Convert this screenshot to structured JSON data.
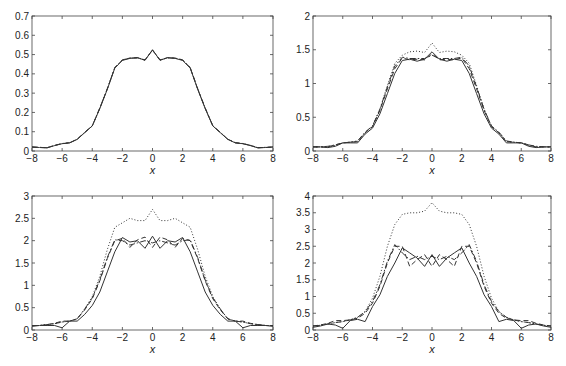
{
  "figure": {
    "width": 566,
    "height": 366,
    "background": "#ffffff",
    "line_color": "#333333"
  },
  "line_styles": {
    "solid": {
      "dash": "",
      "width": 1.0
    },
    "dashed": {
      "dash": "5,3",
      "width": 1.0
    },
    "dashdot": {
      "dash": "6,2,1.5,2",
      "width": 1.0
    },
    "dotted": {
      "dash": "1,2",
      "width": 1.0
    }
  },
  "chart_data": [
    {
      "type": "line",
      "panel": "top-left",
      "title": "",
      "xlabel": "x",
      "ylabel": "",
      "xlim": [
        -8,
        8
      ],
      "ylim": [
        0,
        0.7
      ],
      "xticks": [
        -8,
        -6,
        -4,
        -2,
        0,
        2,
        4,
        6,
        8
      ],
      "xtick_labels": [
        "−8",
        "−6",
        "−4",
        "−2",
        "0",
        "2",
        "4",
        "6",
        "8"
      ],
      "yticks": [
        0,
        0.1,
        0.2,
        0.3,
        0.4,
        0.5,
        0.6,
        0.7
      ],
      "ytick_labels": [
        "0",
        "0.1",
        "0.2",
        "0.3",
        "0.4",
        "0.5",
        "0.6",
        "0.7"
      ],
      "grid": false,
      "legend": null,
      "box": {
        "left": 32,
        "top": 16,
        "right": 273,
        "bottom": 151
      },
      "x": [
        -8,
        -7.5,
        -7,
        -6.5,
        -6,
        -5.5,
        -5,
        -4.5,
        -4,
        -3.5,
        -3,
        -2.5,
        -2,
        -1.5,
        -1,
        -0.5,
        0,
        0.5,
        1,
        1.5,
        2,
        2.5,
        3,
        3.5,
        4,
        4.5,
        5,
        5.5,
        6,
        6.5,
        7,
        7.5,
        8
      ],
      "series": [
        {
          "name": "solid",
          "style": "solid",
          "values": [
            0.02,
            0.018,
            0.016,
            0.028,
            0.038,
            0.042,
            0.06,
            0.095,
            0.13,
            0.22,
            0.32,
            0.43,
            0.47,
            0.48,
            0.485,
            0.47,
            0.525,
            0.47,
            0.485,
            0.48,
            0.47,
            0.43,
            0.32,
            0.22,
            0.13,
            0.095,
            0.06,
            0.042,
            0.038,
            0.028,
            0.016,
            0.018,
            0.02
          ]
        },
        {
          "name": "dashed",
          "style": "dashed",
          "values": [
            0.02,
            0.018,
            0.017,
            0.029,
            0.038,
            0.043,
            0.061,
            0.096,
            0.13,
            0.222,
            0.322,
            0.432,
            0.472,
            0.482,
            0.483,
            0.472,
            0.523,
            0.472,
            0.483,
            0.482,
            0.472,
            0.432,
            0.322,
            0.222,
            0.13,
            0.096,
            0.061,
            0.043,
            0.038,
            0.029,
            0.017,
            0.018,
            0.02
          ]
        },
        {
          "name": "dashdot",
          "style": "dashdot",
          "values": [
            0.021,
            0.019,
            0.017,
            0.029,
            0.039,
            0.043,
            0.061,
            0.097,
            0.131,
            0.223,
            0.323,
            0.433,
            0.473,
            0.481,
            0.482,
            0.473,
            0.522,
            0.473,
            0.482,
            0.481,
            0.473,
            0.433,
            0.323,
            0.223,
            0.131,
            0.097,
            0.061,
            0.043,
            0.039,
            0.029,
            0.017,
            0.019,
            0.021
          ]
        }
      ]
    },
    {
      "type": "line",
      "panel": "top-right",
      "title": "",
      "xlabel": "x",
      "ylabel": "",
      "xlim": [
        -8,
        8
      ],
      "ylim": [
        0,
        2
      ],
      "xticks": [
        -8,
        -6,
        -4,
        -2,
        0,
        2,
        4,
        6,
        8
      ],
      "xtick_labels": [
        "−8",
        "−6",
        "−4",
        "−2",
        "0",
        "2",
        "4",
        "6",
        "8"
      ],
      "yticks": [
        0,
        0.5,
        1,
        1.5,
        2
      ],
      "ytick_labels": [
        "0",
        "0.5",
        "1",
        "1.5",
        "2"
      ],
      "grid": false,
      "legend": null,
      "box": {
        "left": 313,
        "top": 16,
        "right": 551,
        "bottom": 151
      },
      "x": [
        -8,
        -7.5,
        -7,
        -6.5,
        -6,
        -5.5,
        -5,
        -4.5,
        -4,
        -3.5,
        -3,
        -2.5,
        -2,
        -1.5,
        -1,
        -0.5,
        0,
        0.5,
        1,
        1.5,
        2,
        2.5,
        3,
        3.5,
        4,
        4.5,
        5,
        5.5,
        6,
        6.5,
        7,
        7.5,
        8
      ],
      "series": [
        {
          "name": "solid",
          "style": "solid",
          "values": [
            0.06,
            0.06,
            0.05,
            0.07,
            0.12,
            0.12,
            0.12,
            0.25,
            0.34,
            0.55,
            0.85,
            1.15,
            1.34,
            1.36,
            1.33,
            1.36,
            1.47,
            1.36,
            1.33,
            1.36,
            1.34,
            1.15,
            0.85,
            0.55,
            0.34,
            0.25,
            0.12,
            0.12,
            0.12,
            0.07,
            0.05,
            0.06,
            0.06
          ]
        },
        {
          "name": "dashed",
          "style": "dashed",
          "values": [
            0.06,
            0.06,
            0.06,
            0.09,
            0.12,
            0.13,
            0.14,
            0.27,
            0.36,
            0.6,
            0.92,
            1.22,
            1.38,
            1.35,
            1.36,
            1.35,
            1.44,
            1.35,
            1.36,
            1.35,
            1.38,
            1.22,
            0.92,
            0.6,
            0.36,
            0.27,
            0.14,
            0.13,
            0.12,
            0.09,
            0.06,
            0.06,
            0.06
          ]
        },
        {
          "name": "dashdot",
          "style": "dashdot",
          "values": [
            0.06,
            0.06,
            0.07,
            0.09,
            0.12,
            0.13,
            0.15,
            0.28,
            0.37,
            0.62,
            0.95,
            1.26,
            1.39,
            1.37,
            1.37,
            1.37,
            1.42,
            1.37,
            1.37,
            1.37,
            1.39,
            1.26,
            0.95,
            0.62,
            0.37,
            0.28,
            0.15,
            0.13,
            0.12,
            0.09,
            0.07,
            0.06,
            0.06
          ]
        },
        {
          "name": "dotted",
          "style": "dotted",
          "values": [
            0.06,
            0.06,
            0.06,
            0.08,
            0.12,
            0.13,
            0.14,
            0.27,
            0.37,
            0.62,
            0.97,
            1.3,
            1.42,
            1.47,
            1.48,
            1.46,
            1.6,
            1.46,
            1.48,
            1.47,
            1.42,
            1.3,
            0.97,
            0.62,
            0.37,
            0.27,
            0.14,
            0.13,
            0.12,
            0.08,
            0.06,
            0.06,
            0.06
          ]
        }
      ]
    },
    {
      "type": "line",
      "panel": "bottom-left",
      "title": "",
      "xlabel": "x",
      "ylabel": "",
      "xlim": [
        -8,
        8
      ],
      "ylim": [
        0,
        3
      ],
      "xticks": [
        -8,
        -6,
        -4,
        -2,
        0,
        2,
        4,
        6,
        8
      ],
      "xtick_labels": [
        "−8",
        "−6",
        "−4",
        "−2",
        "0",
        "2",
        "4",
        "6",
        "8"
      ],
      "yticks": [
        0,
        0.5,
        1,
        1.5,
        2,
        2.5,
        3
      ],
      "ytick_labels": [
        "0",
        "0.5",
        "1",
        "1.5",
        "2",
        "2.5",
        "3"
      ],
      "grid": false,
      "legend": null,
      "box": {
        "left": 32,
        "top": 196,
        "right": 273,
        "bottom": 330
      },
      "x": [
        -8,
        -7.5,
        -7,
        -6.5,
        -6,
        -5.5,
        -5,
        -4.5,
        -4,
        -3.5,
        -3,
        -2.5,
        -2,
        -1.5,
        -1,
        -0.5,
        0,
        0.5,
        1,
        1.5,
        2,
        2.5,
        3,
        3.5,
        4,
        4.5,
        5,
        5.5,
        6,
        6.5,
        7,
        7.5,
        8
      ],
      "series": [
        {
          "name": "solid",
          "style": "solid",
          "values": [
            0.08,
            0.1,
            0.1,
            0.1,
            0.05,
            0.2,
            0.2,
            0.35,
            0.55,
            0.85,
            1.3,
            1.75,
            2.07,
            1.97,
            2.0,
            1.83,
            2.1,
            1.83,
            2.0,
            1.97,
            2.07,
            1.75,
            1.3,
            0.85,
            0.55,
            0.35,
            0.2,
            0.2,
            0.05,
            0.1,
            0.1,
            0.1,
            0.08
          ]
        },
        {
          "name": "dashed",
          "style": "dashed",
          "values": [
            0.1,
            0.1,
            0.12,
            0.15,
            0.2,
            0.2,
            0.25,
            0.45,
            0.7,
            1.1,
            1.6,
            2.0,
            2.05,
            1.85,
            2.02,
            2.08,
            1.85,
            2.08,
            2.02,
            1.85,
            2.05,
            2.0,
            1.6,
            1.1,
            0.7,
            0.45,
            0.25,
            0.2,
            0.2,
            0.15,
            0.12,
            0.1,
            0.1
          ]
        },
        {
          "name": "dashdot",
          "style": "dashdot",
          "values": [
            0.1,
            0.1,
            0.12,
            0.14,
            0.18,
            0.2,
            0.25,
            0.47,
            0.72,
            1.12,
            1.62,
            2.02,
            2.0,
            1.9,
            1.95,
            2.0,
            1.95,
            2.0,
            1.95,
            1.9,
            2.0,
            2.02,
            1.62,
            1.12,
            0.72,
            0.47,
            0.25,
            0.2,
            0.18,
            0.14,
            0.12,
            0.1,
            0.1
          ]
        },
        {
          "name": "dotted",
          "style": "dotted",
          "values": [
            0.1,
            0.1,
            0.12,
            0.14,
            0.18,
            0.2,
            0.25,
            0.47,
            0.75,
            1.2,
            1.8,
            2.3,
            2.4,
            2.5,
            2.45,
            2.45,
            2.7,
            2.45,
            2.45,
            2.5,
            2.4,
            2.3,
            1.8,
            1.2,
            0.75,
            0.47,
            0.25,
            0.2,
            0.18,
            0.14,
            0.12,
            0.1,
            0.1
          ]
        }
      ]
    },
    {
      "type": "line",
      "panel": "bottom-right",
      "title": "",
      "xlabel": "x",
      "ylabel": "",
      "xlim": [
        -8,
        8
      ],
      "ylim": [
        0,
        4
      ],
      "xticks": [
        -8,
        -6,
        -4,
        -2,
        0,
        2,
        4,
        6,
        8
      ],
      "xtick_labels": [
        "−8",
        "−6",
        "−4",
        "−2",
        "0",
        "2",
        "4",
        "6",
        "8"
      ],
      "yticks": [
        0,
        0.5,
        1,
        1.5,
        2,
        2.5,
        3,
        3.5,
        4
      ],
      "ytick_labels": [
        "0",
        "0.5",
        "1",
        "1.5",
        "2",
        "2.5",
        "3",
        "3.5",
        "4"
      ],
      "grid": false,
      "legend": null,
      "box": {
        "left": 313,
        "top": 196,
        "right": 551,
        "bottom": 330
      },
      "x": [
        -8,
        -7.5,
        -7,
        -6.5,
        -6,
        -5.5,
        -5,
        -4.5,
        -4,
        -3.5,
        -3,
        -2.5,
        -2,
        -1.5,
        -1,
        -0.5,
        0,
        0.5,
        1,
        1.5,
        2,
        2.5,
        3,
        3.5,
        4,
        4.5,
        5,
        5.5,
        6,
        6.5,
        7,
        7.5,
        8
      ],
      "series": [
        {
          "name": "solid",
          "style": "solid",
          "values": [
            0.08,
            0.12,
            0.18,
            0.15,
            0.05,
            0.28,
            0.32,
            0.25,
            0.7,
            1.05,
            1.6,
            2.0,
            2.45,
            2.3,
            2.15,
            1.9,
            2.25,
            1.9,
            2.15,
            2.3,
            2.45,
            2.0,
            1.6,
            1.05,
            0.7,
            0.25,
            0.32,
            0.28,
            0.05,
            0.15,
            0.18,
            0.12,
            0.08
          ]
        },
        {
          "name": "dashed",
          "style": "dashed",
          "values": [
            0.12,
            0.15,
            0.2,
            0.28,
            0.28,
            0.3,
            0.35,
            0.5,
            0.8,
            1.3,
            2.0,
            2.5,
            2.5,
            1.9,
            2.1,
            2.25,
            1.9,
            2.25,
            2.1,
            1.9,
            2.5,
            2.5,
            2.0,
            1.3,
            0.8,
            0.5,
            0.35,
            0.3,
            0.28,
            0.28,
            0.2,
            0.15,
            0.12
          ]
        },
        {
          "name": "dashdot",
          "style": "dashdot",
          "values": [
            0.12,
            0.14,
            0.18,
            0.22,
            0.25,
            0.3,
            0.38,
            0.55,
            0.85,
            1.35,
            2.05,
            2.55,
            2.3,
            2.1,
            2.2,
            2.1,
            2.2,
            2.1,
            2.2,
            2.1,
            2.3,
            2.55,
            2.05,
            1.35,
            0.85,
            0.55,
            0.38,
            0.3,
            0.25,
            0.22,
            0.18,
            0.14,
            0.12
          ]
        },
        {
          "name": "dotted",
          "style": "dotted",
          "values": [
            0.12,
            0.14,
            0.18,
            0.22,
            0.25,
            0.3,
            0.38,
            0.55,
            0.95,
            1.6,
            2.5,
            3.15,
            3.45,
            3.5,
            3.5,
            3.55,
            3.8,
            3.55,
            3.5,
            3.5,
            3.45,
            3.15,
            2.5,
            1.6,
            0.95,
            0.55,
            0.38,
            0.3,
            0.25,
            0.22,
            0.18,
            0.14,
            0.12
          ]
        }
      ]
    }
  ]
}
